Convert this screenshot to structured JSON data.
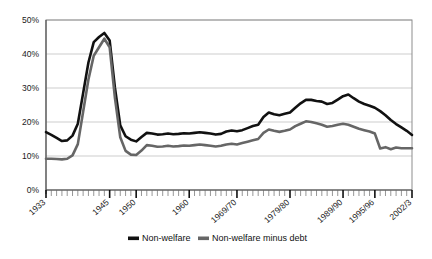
{
  "chart_data": {
    "type": "line",
    "title": "",
    "subtitle": "",
    "xlabel": "",
    "ylabel": "",
    "ylim": [
      0,
      50
    ],
    "yticks": [
      0,
      10,
      20,
      30,
      40,
      50
    ],
    "ytick_labels": [
      "0%",
      "10%",
      "20%",
      "30%",
      "40%",
      "50%"
    ],
    "grid": true,
    "legend_position": "bottom",
    "x_major_labels": [
      "1933",
      "1945",
      "1950",
      "1960",
      "1969/70",
      "1979/80",
      "1989/90",
      "1995/96",
      "2002/3"
    ],
    "x_major_years": [
      1933,
      1945,
      1950,
      1960,
      1969,
      1979,
      1989,
      1995,
      2002
    ],
    "x": [
      1933,
      1934,
      1935,
      1936,
      1937,
      1938,
      1939,
      1940,
      1941,
      1942,
      1943,
      1944,
      1945,
      1946,
      1947,
      1948,
      1949,
      1950,
      1951,
      1952,
      1953,
      1954,
      1955,
      1956,
      1957,
      1958,
      1959,
      1960,
      1961,
      1962,
      1963,
      1964,
      1965,
      1966,
      1967,
      1968,
      1969,
      1970,
      1971,
      1972,
      1973,
      1974,
      1975,
      1976,
      1977,
      1978,
      1979,
      1980,
      1981,
      1982,
      1983,
      1984,
      1985,
      1986,
      1987,
      1988,
      1989,
      1990,
      1991,
      1992,
      1993,
      1994,
      1995,
      1996,
      1997,
      1998,
      1999,
      2000,
      2001,
      2002
    ],
    "series": [
      {
        "name": "Non-welfare",
        "color": "#111111",
        "values": [
          17.0,
          16.2,
          15.3,
          14.4,
          14.6,
          16.0,
          19.5,
          28.5,
          37.5,
          43.5,
          45.0,
          46.2,
          44.0,
          30.0,
          19.0,
          15.8,
          14.8,
          14.3,
          15.6,
          16.8,
          16.6,
          16.3,
          16.4,
          16.6,
          16.4,
          16.5,
          16.7,
          16.6,
          16.8,
          17.0,
          16.8,
          16.6,
          16.3,
          16.5,
          17.2,
          17.5,
          17.3,
          17.6,
          18.2,
          18.8,
          19.2,
          21.5,
          22.8,
          22.3,
          22.0,
          22.4,
          22.8,
          24.2,
          25.5,
          26.5,
          26.5,
          26.2,
          26.0,
          25.3,
          25.6,
          26.6,
          27.6,
          28.1,
          27.0,
          26.0,
          25.3,
          24.8,
          24.2,
          23.2,
          22.0,
          20.6,
          19.4,
          18.4,
          17.4,
          16.2
        ],
        "endpoint_value": 16.2,
        "peak_value": 46.2,
        "peak_year": 1944
      },
      {
        "name": "Non-welfare minus debt",
        "color": "#666666",
        "values": [
          9.2,
          9.2,
          9.1,
          9.0,
          9.2,
          10.2,
          13.5,
          23.0,
          32.5,
          39.5,
          42.0,
          44.5,
          42.0,
          27.0,
          15.5,
          11.5,
          10.4,
          10.3,
          11.6,
          13.2,
          13.0,
          12.7,
          12.8,
          13.0,
          12.8,
          12.9,
          13.1,
          13.0,
          13.2,
          13.4,
          13.2,
          13.0,
          12.8,
          13.0,
          13.4,
          13.6,
          13.4,
          13.8,
          14.2,
          14.6,
          15.0,
          16.8,
          17.8,
          17.4,
          17.1,
          17.4,
          17.8,
          18.8,
          19.5,
          20.2,
          20.0,
          19.6,
          19.2,
          18.6,
          18.8,
          19.2,
          19.5,
          19.2,
          18.6,
          18.0,
          17.6,
          17.2,
          16.6,
          12.2,
          12.6,
          12.0,
          12.5,
          12.3,
          12.3,
          12.3
        ],
        "endpoint_value": 12.3,
        "peak_value": 44.5,
        "peak_year": 1944
      }
    ],
    "legend": [
      {
        "label": "Non-welfare",
        "color": "#111111"
      },
      {
        "label": "Non-welfare minus debt",
        "color": "#666666"
      }
    ]
  }
}
